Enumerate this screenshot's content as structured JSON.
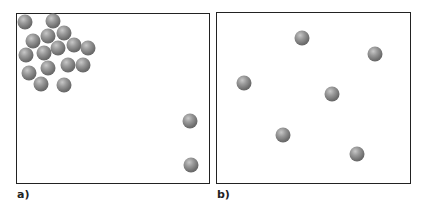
{
  "panels": [
    {
      "label": "a)",
      "box": {
        "left": 16,
        "top": 13,
        "width": 194,
        "height": 171
      },
      "balls": [
        [
          25,
          22
        ],
        [
          53,
          21
        ],
        [
          64,
          33
        ],
        [
          48,
          36
        ],
        [
          33,
          41
        ],
        [
          74,
          45
        ],
        [
          88,
          48
        ],
        [
          58,
          48
        ],
        [
          44,
          53
        ],
        [
          26,
          55
        ],
        [
          68,
          65
        ],
        [
          83,
          65
        ],
        [
          48,
          68
        ],
        [
          29,
          73
        ],
        [
          41,
          84
        ],
        [
          64,
          85
        ],
        [
          190,
          121
        ],
        [
          191,
          165
        ]
      ]
    },
    {
      "label": "b)",
      "box": {
        "left": 216,
        "top": 12,
        "width": 195,
        "height": 172
      },
      "balls": [
        [
          302,
          38
        ],
        [
          375,
          54
        ],
        [
          244,
          83
        ],
        [
          332,
          94
        ],
        [
          283,
          135
        ],
        [
          357,
          154
        ]
      ]
    }
  ],
  "colors": {
    "border": "#222222",
    "ball_dark": "#555555",
    "ball_light": "#c8c8c8"
  }
}
